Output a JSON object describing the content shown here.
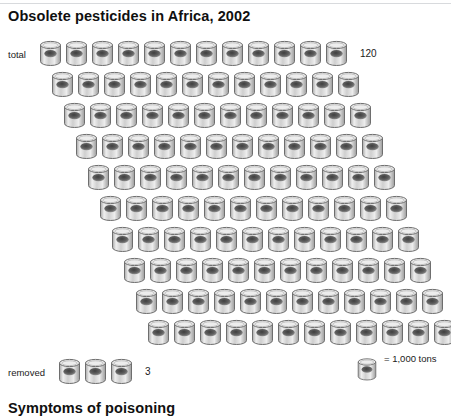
{
  "title": "Obsolete pesticides in Africa, 2002",
  "footer_title": "Symptoms of poisoning",
  "legend": {
    "icon": "barrel-icon",
    "text": "= 1,000 tons",
    "unit_value": 1000,
    "unit_label": "tons"
  },
  "rows": {
    "total_label": "total",
    "total_value": "120",
    "removed_label": "removed",
    "removed_value": "3"
  },
  "chart_data": {
    "type": "pictogram",
    "title": "Obsolete pesticides in Africa, 2002",
    "unit": "1,000 tons per barrel icon",
    "icon": "barrel",
    "categories": [
      "total",
      "removed"
    ],
    "values": [
      120,
      3
    ],
    "value_labels": [
      "120",
      "3"
    ],
    "icons_per_row": 12,
    "total_rows": 10,
    "total_icons": 120,
    "removed_icons": 3,
    "row_indent_px": 12,
    "row_spacing_px": 31,
    "legend": "= 1,000 tons",
    "xlabel": "",
    "ylabel": "",
    "grid": false,
    "series": [
      {
        "name": "total",
        "label": "total",
        "value": 120,
        "display": "120",
        "rows": [
          {
            "index": 1,
            "count": 12,
            "left": 38,
            "top": 40
          },
          {
            "index": 2,
            "count": 12,
            "left": 50,
            "top": 71
          },
          {
            "index": 3,
            "count": 12,
            "left": 62,
            "top": 102
          },
          {
            "index": 4,
            "count": 12,
            "left": 74,
            "top": 133
          },
          {
            "index": 5,
            "count": 12,
            "left": 86,
            "top": 164
          },
          {
            "index": 6,
            "count": 12,
            "left": 98,
            "top": 195
          },
          {
            "index": 7,
            "count": 12,
            "left": 110,
            "top": 226
          },
          {
            "index": 8,
            "count": 12,
            "left": 122,
            "top": 257
          },
          {
            "index": 9,
            "count": 12,
            "left": 134,
            "top": 288
          },
          {
            "index": 10,
            "count": 12,
            "left": 146,
            "top": 319
          }
        ]
      },
      {
        "name": "removed",
        "label": "removed",
        "value": 3,
        "display": "3",
        "rows": [
          {
            "index": 1,
            "count": 3,
            "left": 57,
            "top": 358
          }
        ]
      }
    ]
  },
  "colors": {
    "background": "#ffffff",
    "text": "#1a1a1a",
    "title": "#101010",
    "rule": "#d8dadd",
    "barrel_outline": "#6e6e6e",
    "barrel_light": "#f2f2f2",
    "barrel_mid": "#c9c9c9",
    "barrel_dark": "#8d8d8d",
    "barrel_spot": "#555555"
  }
}
